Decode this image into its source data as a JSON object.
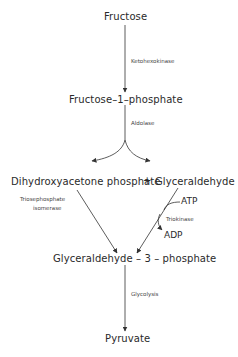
{
  "diagram": {
    "type": "metabolic-pathway",
    "nodes": {
      "fructose": "Fructose",
      "fructose_1_phosphate": "Fructose–1–phosphate",
      "dhap": "Dihydroxyacetone phosphate",
      "plus": "+",
      "glyceraldehyde": "Glyceraldehyde",
      "g3p": "Glyceraldehyde – 3 – phosphate",
      "pyruvate": "Pyruvate"
    },
    "enzymes": {
      "ketohexokinase": "Ketohexokinase",
      "aldolase": "Aldolase",
      "triosephosphate_isomerase_line1": "Triosephosphate",
      "triosephosphate_isomerase_line2": "isomerase",
      "triokinase": "Triokinase",
      "glycolysis": "Glycolysis"
    },
    "cofactors": {
      "atp": "ATP",
      "adp": "ADP"
    },
    "edges": [
      {
        "from": "Fructose",
        "to": "Fructose-1-phosphate",
        "label": "Ketohexokinase"
      },
      {
        "from": "Fructose-1-phosphate",
        "to": "Dihydroxyacetone phosphate",
        "label": "Aldolase"
      },
      {
        "from": "Fructose-1-phosphate",
        "to": "Glyceraldehyde",
        "label": "Aldolase"
      },
      {
        "from": "Dihydroxyacetone phosphate",
        "to": "Glyceraldehyde-3-phosphate",
        "label": "Triosephosphate isomerase"
      },
      {
        "from": "Glyceraldehyde",
        "to": "Glyceraldehyde-3-phosphate",
        "label": "Triokinase",
        "cofactor_in": "ATP",
        "cofactor_out": "ADP"
      },
      {
        "from": "Glyceraldehyde-3-phosphate",
        "to": "Pyruvate",
        "label": "Glycolysis"
      }
    ]
  }
}
